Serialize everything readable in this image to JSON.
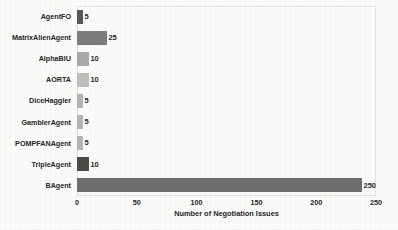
{
  "chart_data": {
    "type": "bar",
    "orientation": "horizontal",
    "title": "",
    "xlabel": "Number of Negotiation Issues",
    "ylabel": "",
    "xlim": [
      0,
      250
    ],
    "xticks": [
      0,
      50,
      100,
      150,
      200,
      250
    ],
    "xtick_labels": [
      "0",
      "50",
      "100",
      "150",
      "200",
      "250"
    ],
    "grid": false,
    "legend": "none",
    "categories": [
      "AgentFO",
      "MatrixAlienAgent",
      "AlphaBIU",
      "AORTA",
      "DiceHaggler",
      "GamblerAgent",
      "POMPFANAgent",
      "TripleAgent",
      "BAgent"
    ],
    "values": [
      5,
      25,
      10,
      10,
      5,
      5,
      5,
      10,
      250
    ],
    "data_labels": [
      "5",
      "25",
      "10",
      "10",
      "5",
      "5",
      "5",
      "10",
      "250"
    ],
    "bar_colors": [
      "#585858",
      "#7c7c7c",
      "#a9a9a9",
      "#bdbdbd",
      "#b4b4b4",
      "#b4b4b4",
      "#b4b4b4",
      "#4a4a4a",
      "#6e6e6e"
    ],
    "bars": [
      {
        "category": "AgentFO",
        "value": 5,
        "label": "5",
        "color": "#585858"
      },
      {
        "category": "MatrixAlienAgent",
        "value": 25,
        "label": "25",
        "color": "#7c7c7c"
      },
      {
        "category": "AlphaBIU",
        "value": 10,
        "label": "10",
        "color": "#a9a9a9"
      },
      {
        "category": "AORTA",
        "value": 10,
        "label": "10",
        "color": "#bdbdbd"
      },
      {
        "category": "DiceHaggler",
        "value": 5,
        "label": "5",
        "color": "#b4b4b4"
      },
      {
        "category": "GamblerAgent",
        "value": 5,
        "label": "5",
        "color": "#b4b4b4"
      },
      {
        "category": "POMPFANAgent",
        "value": 5,
        "label": "5",
        "color": "#b4b4b4"
      },
      {
        "category": "TripleAgent",
        "value": 10,
        "label": "10",
        "color": "#4a4a4a"
      },
      {
        "category": "BAgent",
        "value": 250,
        "label": "250",
        "color": "#6e6e6e"
      }
    ],
    "background_color": "#fbfbfa",
    "axis_border_color": "#e3e2e0",
    "text_color": "#262626"
  }
}
